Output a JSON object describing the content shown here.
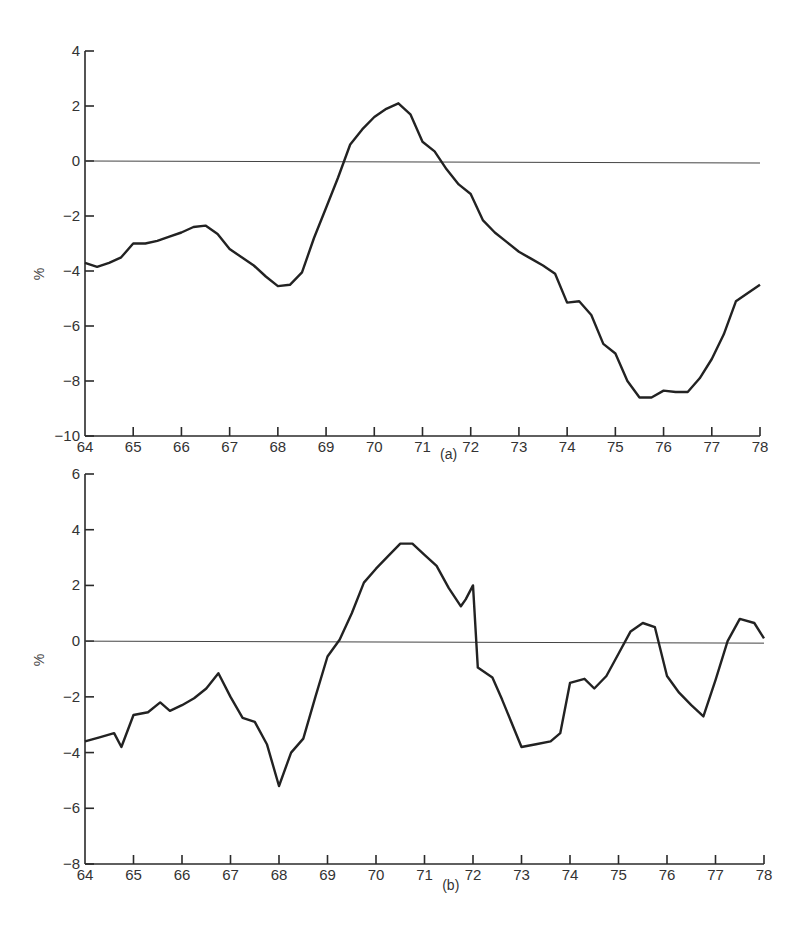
{
  "chart_data": [
    {
      "type": "line",
      "panel_label": "(a)",
      "title": "",
      "xlabel": "",
      "ylabel": "%",
      "xlim": [
        64,
        78
      ],
      "ylim": [
        -10,
        4
      ],
      "xticks": [
        64,
        65,
        66,
        67,
        68,
        69,
        70,
        71,
        72,
        73,
        74,
        75,
        76,
        77,
        78
      ],
      "yticks": [
        4,
        2,
        0,
        -2,
        -4,
        -6,
        -8,
        -10
      ],
      "reference_line": 0,
      "series": [
        {
          "name": "a",
          "x": [
            64.0,
            64.25,
            64.5,
            64.75,
            65.0,
            65.25,
            65.5,
            65.75,
            66.0,
            66.25,
            66.5,
            66.75,
            67.0,
            67.25,
            67.5,
            67.75,
            68.0,
            68.25,
            68.5,
            68.75,
            69.0,
            69.25,
            69.5,
            69.75,
            70.0,
            70.25,
            70.5,
            70.75,
            71.0,
            71.25,
            71.5,
            71.75,
            72.0,
            72.25,
            72.5,
            72.75,
            73.0,
            73.25,
            73.5,
            73.75,
            74.0,
            74.25,
            74.5,
            74.75,
            75.0,
            75.25,
            75.5,
            75.75,
            76.0,
            76.25,
            76.5,
            76.75,
            77.0,
            77.25,
            77.5,
            77.75,
            78.0
          ],
          "values": [
            -3.7,
            -3.85,
            -3.7,
            -3.5,
            -3.0,
            -3.0,
            -2.9,
            -2.75,
            -2.6,
            -2.4,
            -2.35,
            -2.65,
            -3.2,
            -3.5,
            -3.8,
            -4.2,
            -4.55,
            -4.5,
            -4.05,
            -2.8,
            -1.7,
            -0.6,
            0.6,
            1.15,
            1.6,
            1.9,
            2.1,
            1.7,
            0.7,
            0.35,
            -0.3,
            -0.85,
            -1.2,
            -2.15,
            -2.6,
            -2.95,
            -3.3,
            -3.55,
            -3.8,
            -4.1,
            -5.15,
            -5.1,
            -5.6,
            -6.65,
            -7.0,
            -8.0,
            -8.6,
            -8.6,
            -8.35,
            -8.4,
            -8.4,
            -7.9,
            -7.2,
            -6.3,
            -5.1,
            -4.8,
            -4.5
          ]
        }
      ]
    },
    {
      "type": "line",
      "panel_label": "(b)",
      "title": "",
      "xlabel": "",
      "ylabel": "%",
      "xlim": [
        64,
        78
      ],
      "ylim": [
        -8,
        6
      ],
      "xticks": [
        64,
        65,
        66,
        67,
        68,
        69,
        70,
        71,
        72,
        73,
        74,
        75,
        76,
        77,
        78
      ],
      "yticks": [
        6,
        4,
        2,
        0,
        -2,
        -4,
        -6,
        -8
      ],
      "reference_line": 0,
      "series": [
        {
          "name": "b",
          "x": [
            64.0,
            64.3,
            64.6,
            64.75,
            65.0,
            65.3,
            65.55,
            65.75,
            66.0,
            66.25,
            66.5,
            66.75,
            67.0,
            67.25,
            67.5,
            67.75,
            68.0,
            68.25,
            68.5,
            68.75,
            69.0,
            69.25,
            69.5,
            69.75,
            70.0,
            70.25,
            70.5,
            70.75,
            71.0,
            71.25,
            71.5,
            71.75,
            71.85,
            72.0,
            72.1,
            72.4,
            72.6,
            73.0,
            73.3,
            73.6,
            73.8,
            74.0,
            74.3,
            74.5,
            74.75,
            75.0,
            75.25,
            75.5,
            75.75,
            76.0,
            76.25,
            76.5,
            76.75,
            77.0,
            77.25,
            77.5,
            77.8,
            78.0
          ],
          "values": [
            -3.6,
            -3.45,
            -3.3,
            -3.8,
            -2.65,
            -2.55,
            -2.2,
            -2.5,
            -2.3,
            -2.05,
            -1.7,
            -1.15,
            -2.0,
            -2.75,
            -2.9,
            -3.7,
            -5.2,
            -4.0,
            -3.5,
            -2.0,
            -0.55,
            0.05,
            1.0,
            2.1,
            2.6,
            3.05,
            3.5,
            3.5,
            3.1,
            2.7,
            1.9,
            1.25,
            1.5,
            2.0,
            -0.95,
            -1.3,
            -2.1,
            -3.8,
            -3.7,
            -3.6,
            -3.3,
            -1.5,
            -1.35,
            -1.7,
            -1.25,
            -0.45,
            0.35,
            0.65,
            0.5,
            -1.25,
            -1.85,
            -2.3,
            -2.7,
            -1.4,
            0.0,
            0.8,
            0.65,
            0.1
          ]
        }
      ]
    }
  ],
  "panels": {
    "a": {
      "label": "(a)",
      "ylabel": "%"
    },
    "b": {
      "label": "(b)",
      "ylabel": "%"
    }
  },
  "colors": {
    "line": "#222222",
    "axis": "#2a2a2a",
    "background": "#ffffff"
  }
}
